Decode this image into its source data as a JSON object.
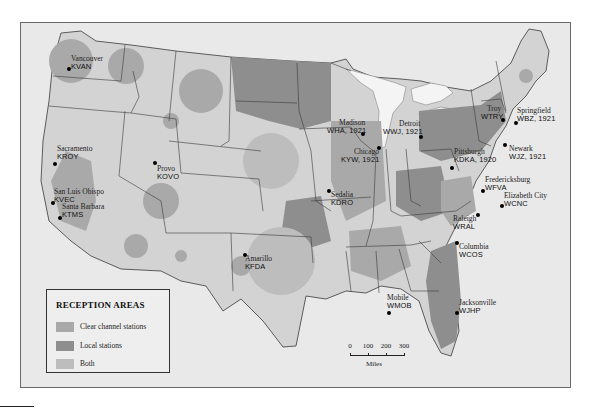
{
  "map": {
    "subject": "Radio broadcast reception areas, United States",
    "colors": {
      "background": "#e9e9e9",
      "land": "#d3d3d3",
      "clear_channel": "#a9a9a9",
      "local": "#8e8e8e",
      "both": "#bdbdbd",
      "water": "#f4f4f4",
      "border": "#3a3a3a"
    },
    "stations": [
      {
        "city": "Vancouver",
        "call": "KVAN",
        "year": ""
      },
      {
        "city": "Sacramento",
        "call": "KROY",
        "year": ""
      },
      {
        "city": "San Luis Obispo",
        "call": "KVEC",
        "year": ""
      },
      {
        "city": "Santa Barbara",
        "call": "KTMS",
        "year": ""
      },
      {
        "city": "Provo",
        "call": "KOVO",
        "year": ""
      },
      {
        "city": "Amarillo",
        "call": "KFDA",
        "year": ""
      },
      {
        "city": "Sedalia",
        "call": "KDRO",
        "year": ""
      },
      {
        "city": "Madison",
        "call": "WHA, 1921",
        "year": "1921"
      },
      {
        "city": "Chicago",
        "call": "KYW, 1921",
        "year": "1921"
      },
      {
        "city": "Detroit",
        "call": "WWJ, 1921",
        "year": "1921"
      },
      {
        "city": "Pittsburgh",
        "call": "KDKA, 1920",
        "year": "1920"
      },
      {
        "city": "Troy",
        "call": "WTRY",
        "year": ""
      },
      {
        "city": "Springfield",
        "call": "WBZ, 1921",
        "year": "1921"
      },
      {
        "city": "Newark",
        "call": "WJZ, 1921",
        "year": "1921"
      },
      {
        "city": "Fredericksburg",
        "call": "WFVA",
        "year": ""
      },
      {
        "city": "Elizabeth City",
        "call": "WCNC",
        "year": ""
      },
      {
        "city": "Raleigh",
        "call": "WRAL",
        "year": ""
      },
      {
        "city": "Columbia",
        "call": "WCOS",
        "year": ""
      },
      {
        "city": "Mobile",
        "call": "WMOB",
        "year": ""
      },
      {
        "city": "Jacksonville",
        "call": "WJHP",
        "year": ""
      }
    ]
  },
  "legend": {
    "title": "RECEPTION AREAS",
    "items": [
      {
        "label": "Clear channel stations",
        "color": "#a9a9a9"
      },
      {
        "label": "Local stations",
        "color": "#8e8e8e"
      },
      {
        "label": "Both",
        "color": "#bdbdbd"
      }
    ]
  },
  "scale": {
    "ticks": [
      "0",
      "100",
      "200",
      "300"
    ],
    "unit": "Miles"
  }
}
